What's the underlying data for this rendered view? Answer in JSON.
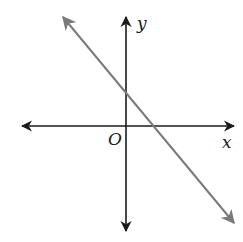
{
  "diagram": {
    "type": "coordinate-plane",
    "axes": {
      "x_label": "x",
      "y_label": "y",
      "origin_label": "O",
      "color": "#1a1a1a"
    },
    "line": {
      "description": "straight line with negative slope, positive y-intercept and positive x-intercept",
      "color": "#7a7a7a",
      "slope_sign": "negative",
      "y_intercept_sign": "positive",
      "x_intercept_sign": "positive"
    }
  }
}
